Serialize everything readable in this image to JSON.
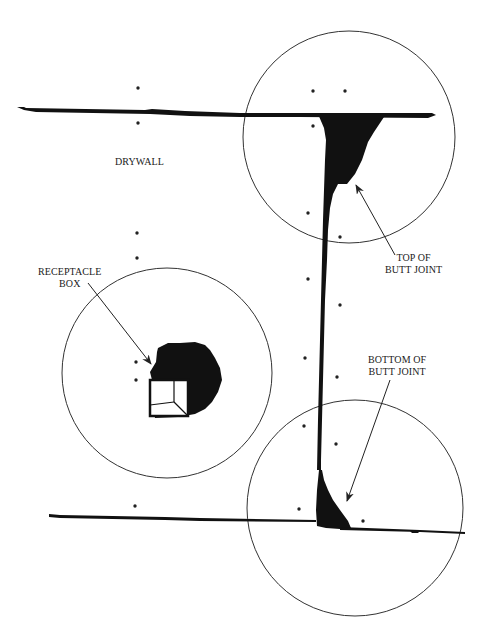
{
  "diagram": {
    "labels": {
      "drywall": "DRYWALL",
      "receptacle_line1": "RECEPTACLE",
      "receptacle_line2": "BOX",
      "top_line1": "TOP OF",
      "top_line2": "BUTT JOINT",
      "bottom_line1": "BOTTOM OF",
      "bottom_line2": "BUTT JOINT"
    },
    "colors": {
      "ink": "#111111",
      "outline": "#333333",
      "background": "#ffffff"
    },
    "circles": [
      {
        "name": "top-of-butt-joint-circle",
        "cx": 349,
        "cy": 137,
        "r": 106
      },
      {
        "name": "receptacle-box-circle",
        "cx": 167,
        "cy": 373,
        "r": 105
      },
      {
        "name": "bottom-of-butt-joint-circle",
        "cx": 355,
        "cy": 508,
        "r": 108
      }
    ],
    "fastener_dots": [
      [
        138,
        88
      ],
      [
        138,
        123
      ],
      [
        313,
        91
      ],
      [
        345,
        91
      ],
      [
        313,
        126
      ],
      [
        308,
        213
      ],
      [
        340,
        237
      ],
      [
        308,
        279
      ],
      [
        340,
        305
      ],
      [
        137,
        233
      ],
      [
        137,
        258
      ],
      [
        137,
        362
      ],
      [
        137,
        380
      ],
      [
        305,
        358
      ],
      [
        337,
        377
      ],
      [
        304,
        426
      ],
      [
        336,
        444
      ],
      [
        135,
        506
      ],
      [
        299,
        509
      ],
      [
        363,
        521
      ]
    ]
  }
}
